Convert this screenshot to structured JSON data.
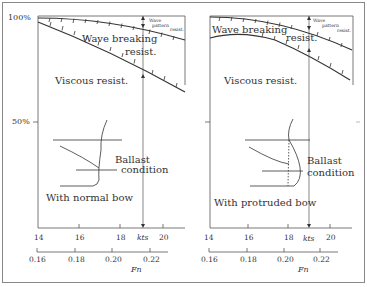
{
  "figure": {
    "left_panel": {
      "label": "With normal bow",
      "y_ticks": [
        "100%",
        "50%"
      ],
      "regions": {
        "wave_pattern": [
          "Wave",
          "pattern",
          "resist."
        ],
        "wave_breaking": [
          "Wave breaking",
          "resist."
        ],
        "viscous": "Viscous resist."
      },
      "inset_label": [
        "Ballast",
        "condition"
      ],
      "kts_ticks": [
        "14",
        "16",
        "18",
        "20"
      ],
      "kts_label": "kts",
      "fn_ticks": [
        "0.16",
        "0.18",
        "0.20",
        "0.22"
      ],
      "fn_label": "Fn"
    },
    "right_panel": {
      "label": "With protruded bow",
      "regions": {
        "wave_pattern": [
          "Wave",
          "pattern",
          "resist."
        ],
        "wave_breaking": [
          "Wave breaking",
          "resist."
        ],
        "viscous": "Viscous resist."
      },
      "inset_label": [
        "Ballast",
        "condition"
      ],
      "kts_ticks": [
        "14",
        "16",
        "18",
        "20"
      ],
      "kts_label": "kts",
      "fn_ticks": [
        "0.16",
        "0.18",
        "0.20",
        "0.22"
      ],
      "fn_label": "Fn"
    }
  }
}
